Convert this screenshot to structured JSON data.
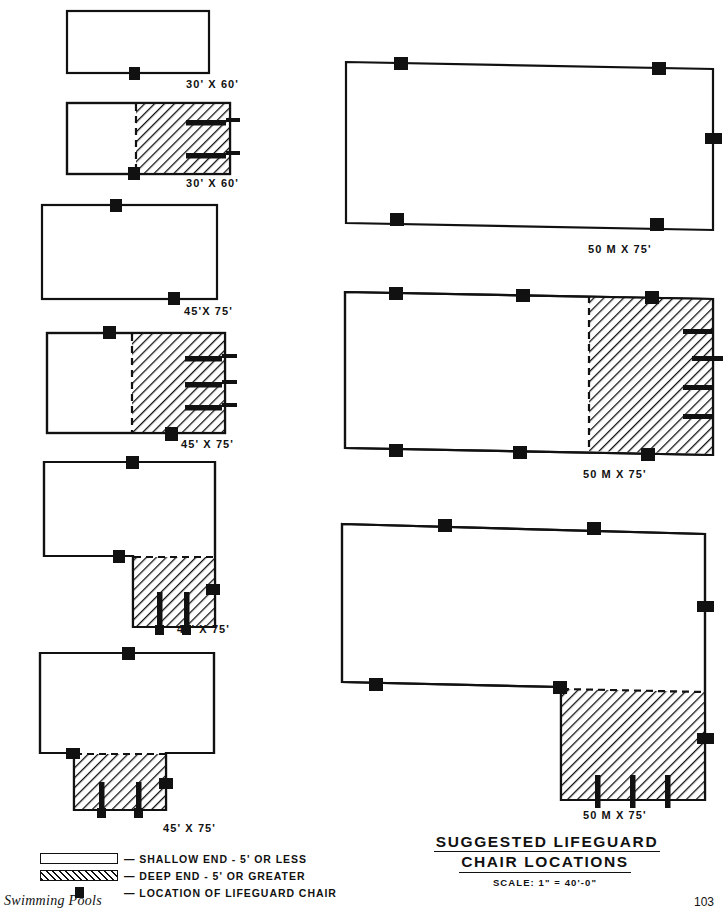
{
  "sheet": {
    "title_line1": "SUGGESTED    LIFEGUARD",
    "title_line2": "CHAIR   LOCATIONS",
    "scale": "SCALE:  1\" = 40'-0\"",
    "book_title": "Swimming Pools",
    "page_number": "103",
    "ink_color": "#111111",
    "paper_color": "#ffffff"
  },
  "legend": {
    "items": [
      {
        "swatch": "shallow-swatch",
        "label": "— SHALLOW  END - 5'  OR  LESS"
      },
      {
        "swatch": "deep-swatch",
        "label": "— DEEP  END - 5'  OR  GREATER"
      },
      {
        "swatch": "chair-swatch",
        "label": "— LOCATION  OF  LIFEGUARD  CHAIR"
      }
    ]
  },
  "pools": [
    {
      "id": "pool-30x60-plain",
      "dimension_label": "30' X 60'",
      "column": "left",
      "shape": "rectangle",
      "has_deep_end": false,
      "chair_count": 1,
      "diving_board_count": 0
    },
    {
      "id": "pool-30x60-deep",
      "dimension_label": "30' X 60'",
      "column": "left",
      "shape": "rectangle",
      "has_deep_end": true,
      "chair_count": 1,
      "diving_board_count": 2
    },
    {
      "id": "pool-45x75-plain",
      "dimension_label": "45'X 75'",
      "column": "left",
      "shape": "rectangle",
      "has_deep_end": false,
      "chair_count": 2,
      "diving_board_count": 0
    },
    {
      "id": "pool-45x75-deep",
      "dimension_label": "45' X 75'",
      "column": "left",
      "shape": "rectangle",
      "has_deep_end": true,
      "chair_count": 2,
      "diving_board_count": 3
    },
    {
      "id": "pool-45x75-l-shape",
      "dimension_label": "45' X 75'",
      "column": "left",
      "shape": "l-shape",
      "has_deep_end": true,
      "chair_count": 3,
      "diving_board_count": 2
    },
    {
      "id": "pool-45x75-t-shape",
      "dimension_label": "45' X 75'",
      "column": "left",
      "shape": "t-shape",
      "has_deep_end": true,
      "chair_count": 3,
      "diving_board_count": 2
    },
    {
      "id": "pool-50m-x-75-plain",
      "dimension_label": "50 M  X  75'",
      "column": "right",
      "shape": "rectangle",
      "has_deep_end": false,
      "chair_count": 5,
      "diving_board_count": 0
    },
    {
      "id": "pool-50m-x-75-deep",
      "dimension_label": "50 M X 75'",
      "column": "right",
      "shape": "rectangle",
      "has_deep_end": true,
      "chair_count": 6,
      "diving_board_count": 4
    },
    {
      "id": "pool-50m-x-75-l-shape",
      "dimension_label": "50 M X 75'",
      "column": "right",
      "shape": "l-shape",
      "has_deep_end": true,
      "chair_count": 6,
      "diving_board_count": 3
    }
  ]
}
